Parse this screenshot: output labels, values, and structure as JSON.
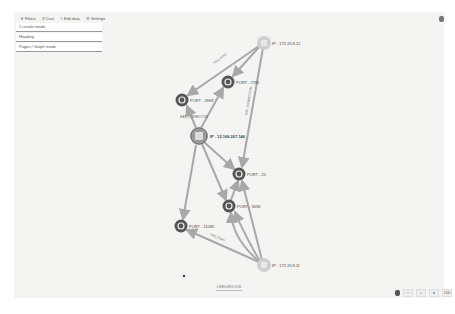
{
  "toolbar": {
    "filters_label": "Filters",
    "cost_label": "Cost",
    "edit_label": "Edit data",
    "settings_label": "Settings"
  },
  "panel": {
    "rows": [
      {
        "label": "1 results mode"
      },
      {
        "label": "Heading"
      },
      {
        "label": "Pages / Graph mode"
      }
    ]
  },
  "graph": {
    "nodes": [
      {
        "id": "ip1",
        "label": "IP - 172.19.8.12",
        "type": "ip"
      },
      {
        "id": "p2761",
        "label": "PORT - 2761",
        "type": "port"
      },
      {
        "id": "p3968",
        "label": "PORT - 3968",
        "type": "port"
      },
      {
        "id": "main",
        "label": "IP - 12.166.207.146",
        "type": "ip-main"
      },
      {
        "id": "p25",
        "label": "PORT - 25",
        "type": "port"
      },
      {
        "id": "p3036",
        "label": "PORT - 3036",
        "type": "port"
      },
      {
        "id": "p11081",
        "label": "PORT - 11081",
        "type": "port"
      },
      {
        "id": "ip2",
        "label": "IP - 172.19.8.11",
        "type": "ip"
      }
    ],
    "edges": [
      {
        "label": "HAS_PORT"
      },
      {
        "label": "HAS_CONNECTION"
      },
      {
        "label": "HAS_CONNECTION"
      },
      {
        "label": "HAS_PORT"
      }
    ],
    "colors": {
      "edge": "#a8a8a8",
      "port_outer": "#555555",
      "port_inner": "#f0f0f0",
      "ip_fill": "#cfcfcf",
      "main_fill": "#999999"
    }
  },
  "footer": {
    "logo_text": "LINKURIOUS",
    "zoom_label": "100"
  }
}
